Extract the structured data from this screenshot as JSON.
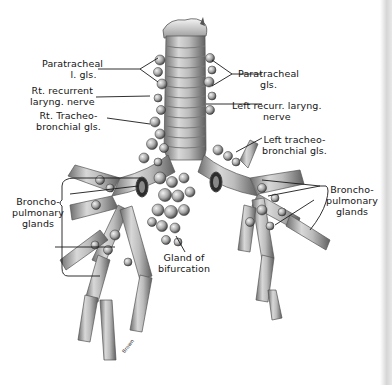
{
  "figure": {
    "style": "grayscale anatomical illustration"
  },
  "labels": {
    "paratracheal_left": {
      "line1": "Paratracheal",
      "line2": "l. gls."
    },
    "rt_recurrent": {
      "line1": "Rt. recurrent",
      "line2": "laryng. nerve"
    },
    "rt_tracheobronchial": {
      "line1": "Rt. Tracheo-",
      "line2": "bronchial gls."
    },
    "paratracheal_right": {
      "line1": "Paratracheal",
      "line2": "gls."
    },
    "left_recurr": {
      "line1": "Left recurr. laryng.",
      "line2": "nerve"
    },
    "left_tracheobronchial": {
      "line1": "Left tracheo-",
      "line2": "bronchial gls."
    },
    "bronchopulmonary_left": {
      "line1": "Broncho-",
      "line2": "pulmonary",
      "line3": "glands"
    },
    "bronchopulmonary_right": {
      "line1": "Broncho-",
      "line2": "pulmonary",
      "line3": "glands"
    },
    "bifurcation": {
      "line1": "Gland of",
      "line2": "bifurcation"
    }
  },
  "signature": "Brown",
  "colors": {
    "background": "#ffffff",
    "ink": "#151515",
    "tissue_light": "#d9d9d9",
    "tissue_mid": "#a8a8a8",
    "tissue_dark": "#5a5a5a"
  }
}
